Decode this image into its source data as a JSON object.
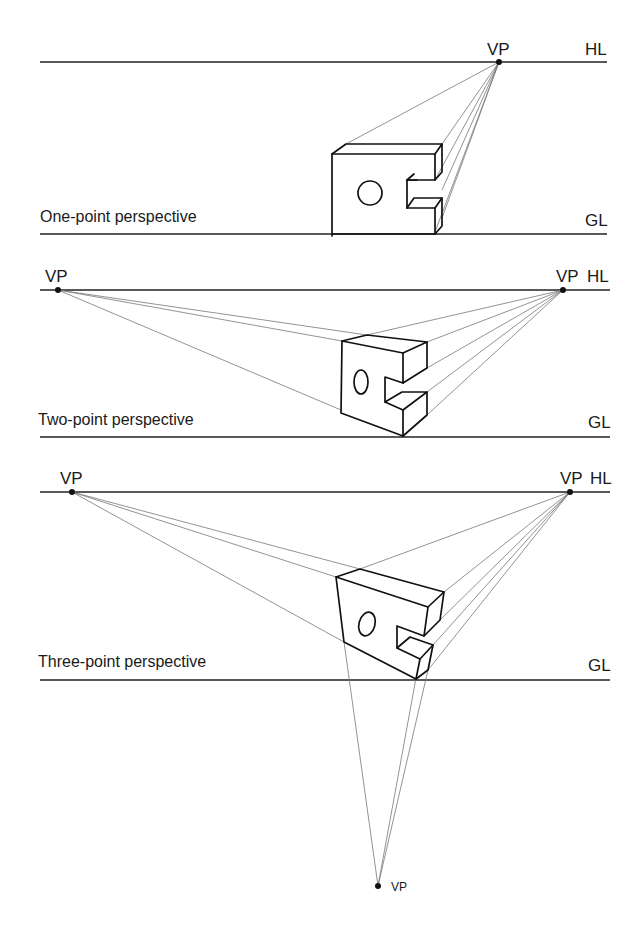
{
  "panels": [
    {
      "caption": "One-point perspective",
      "vp_labels": [
        "VP"
      ],
      "horizon_label": "HL",
      "ground_label": "GL",
      "vanishing_points": [
        {
          "x": 499,
          "y": 62
        }
      ],
      "horizon_y": 62,
      "ground_y": 234
    },
    {
      "caption": "Two-point perspective",
      "vp_labels": [
        "VP",
        "VP"
      ],
      "horizon_label": "HL",
      "ground_label": "GL",
      "vanishing_points": [
        {
          "x": 58,
          "y": 290
        },
        {
          "x": 563,
          "y": 290
        }
      ],
      "horizon_y": 290,
      "ground_y": 437
    },
    {
      "caption": "Three-point perspective",
      "vp_labels": [
        "VP",
        "VP",
        "VP"
      ],
      "horizon_label": "HL",
      "ground_label": "GL",
      "vanishing_points": [
        {
          "x": 72,
          "y": 492
        },
        {
          "x": 570,
          "y": 492
        },
        {
          "x": 378,
          "y": 886
        }
      ],
      "horizon_y": 492,
      "ground_y": 680
    }
  ],
  "colors": {
    "ink": "#111111",
    "construction": "#777777",
    "background": "#ffffff"
  }
}
